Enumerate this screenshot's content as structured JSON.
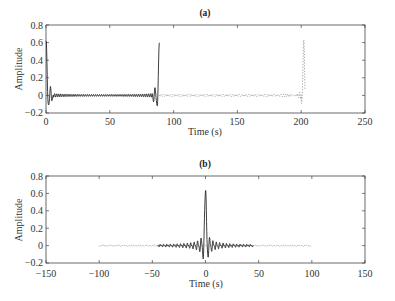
{
  "chart_data": [
    {
      "type": "line",
      "panel": "a",
      "title": "(a)",
      "xlabel": "Time (s)",
      "ylabel": "Amplitude",
      "xlim": [
        0,
        250
      ],
      "ylim": [
        -0.2,
        0.8
      ],
      "xticks": [
        0,
        50,
        100,
        150,
        200,
        250
      ],
      "yticks": [
        -0.2,
        0,
        0.2,
        0.4,
        0.6,
        0.8
      ],
      "ytick_labels": [
        "-0.2",
        "0",
        "0.2",
        "0.4",
        "0.6",
        "0.8"
      ],
      "grid": false,
      "series": [
        {
          "name": "solid",
          "style": "solid",
          "x_range": [
            0,
            89
          ],
          "spike_at": 89,
          "spike_peak": 0.62,
          "min": -0.15,
          "description": "oscillation near 0 with large spikes at ~0 s and ~89 s"
        },
        {
          "name": "dotted",
          "style": "dotted",
          "x_range": [
            89,
            203
          ],
          "spike_at": 202,
          "spike_peak": 0.62,
          "min": -0.12,
          "description": "oscillation near 0 with spike at ~202 s"
        }
      ]
    },
    {
      "type": "line",
      "panel": "b",
      "title": "(b)",
      "xlabel": "Time (s)",
      "ylabel": "Amplitude",
      "xlim": [
        -150,
        150
      ],
      "ylim": [
        -0.2,
        0.8
      ],
      "xticks": [
        -150,
        -100,
        -50,
        0,
        50,
        100,
        150
      ],
      "yticks": [
        -0.2,
        0,
        0.2,
        0.4,
        0.6,
        0.8
      ],
      "ytick_labels": [
        "-0.2",
        "0",
        "0.2",
        "0.4",
        "0.6",
        "0.8"
      ],
      "grid": false,
      "series": [
        {
          "name": "solid",
          "style": "solid",
          "x_range": [
            -45,
            45
          ],
          "spike_at": 0,
          "spike_peak": 0.63,
          "min": -0.15,
          "description": "sinc-like pulse centered at 0 s"
        },
        {
          "name": "dotted",
          "style": "dotted",
          "x_range": [
            -100,
            100
          ],
          "spike_at": null,
          "description": "low amplitude near-zero tail"
        }
      ]
    }
  ],
  "panels": {
    "a": {
      "title": "(a)",
      "xlabel": "Time (s)",
      "ylabel": "Amplitude",
      "xtick_labels": [
        "0",
        "50",
        "100",
        "150",
        "200",
        "250"
      ],
      "ytick_labels": [
        "−0.2",
        "0",
        "0.2",
        "0.4",
        "0.6",
        "0.8"
      ]
    },
    "b": {
      "title": "(b)",
      "xlabel": "Time (s)",
      "ylabel": "Amplitude",
      "xtick_labels": [
        "−150",
        "−100",
        "−50",
        "0",
        "50",
        "100",
        "150"
      ],
      "ytick_labels": [
        "−0.2",
        "0",
        "0.2",
        "0.4",
        "0.6",
        "0.8"
      ]
    }
  },
  "colors": {
    "solid": "#2a2a2a",
    "dotted": "#8a8a8a",
    "axis": "#444444"
  }
}
